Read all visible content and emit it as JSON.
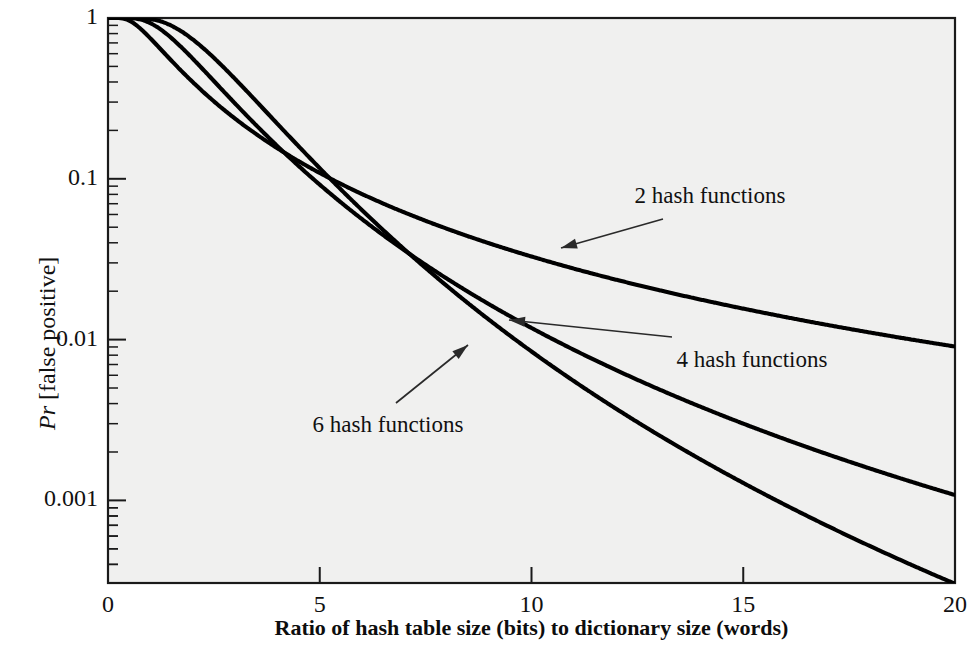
{
  "figure": {
    "background": "#ffffff",
    "plot_background": "#f0f0ef",
    "line_color": "#000000",
    "axis_color": "#1a1a1a"
  },
  "axis_titles": {
    "x": "Ratio of hash table size (bits) to dictionary size (words)",
    "y_prefix": "Pr",
    "y_suffix": " [false positive]"
  },
  "x_ticks": [
    "0",
    "5",
    "10",
    "15",
    "20"
  ],
  "y_ticks": [
    "1",
    "0.1",
    "0.01",
    "0.001"
  ],
  "annotations": {
    "k2": "2 hash functions",
    "k4": "4 hash functions",
    "k6": "6 hash functions"
  },
  "bleed_text": [
    "to the hash table, we set to 1. Check for a 1 in",
    "each seventh bit of the hash table; if it is 1, then the",
    "is false.",
    "When a new password is presented to the system,",
    "calculated and the corresponding bits of the hash table are",
    "password is easy. All passwords in the dictionary will be",
    "also be some  false positives  if a password is rejected, it",
    "but produce a match in the hash table. Set the number of",
    "hash functions. Suppose that the password is the same and",
    "dictionary is the same. To further suppose that",
    "Pr(no match) = (1 - 1/N)^(kn)   Pr(match|not in) < (1 -  ... )^k   (A)(1-",
    "and 2k(1/N)   ...   2ks   ...   (1-1/N)^(kn) ... 6.5s   1s.2k  9.5s",
    "In the password/MC step it is presented to the system, it is",
    "enough function to the dictionary; if there are too many such filter",
    "different to lead to each password; if they would, we would need"
  ],
  "chart_data": {
    "type": "line",
    "title": "",
    "xlabel": "Ratio of hash table size (bits) to dictionary size (words)",
    "ylabel": "Pr [false positive]",
    "xlim": [
      0,
      20
    ],
    "ylim": [
      0.00035,
      1
    ],
    "yscale": "log",
    "grid": false,
    "legend": "inline-annotations",
    "x": [
      0,
      1,
      2,
      3,
      4,
      5,
      6,
      7,
      8,
      9,
      10,
      11,
      12,
      13,
      14,
      15,
      16,
      17,
      18,
      19,
      20
    ],
    "series": [
      {
        "name": "2 hash functions",
        "k": 2,
        "values": [
          1.0,
          0.6322,
          0.3996,
          0.2653,
          0.1847,
          0.134,
          0.1005,
          0.0775,
          0.0611,
          0.0492,
          0.0402,
          0.0334,
          0.0281,
          0.0239,
          0.0205,
          0.0178,
          0.0155,
          0.0136,
          0.012,
          0.0107,
          0.0095
        ]
      },
      {
        "name": "4 hash functions",
        "k": 4,
        "values": [
          1.0,
          0.9204,
          0.6396,
          0.406,
          0.2496,
          0.1549,
          0.0982,
          0.0639,
          0.0426,
          0.0291,
          0.0203,
          0.0145,
          0.0105,
          0.0077,
          0.0058,
          0.0044,
          0.0034,
          0.0026,
          0.0021,
          0.0016,
          0.0013
        ]
      },
      {
        "name": "6 hash functions",
        "k": 6,
        "values": [
          1.0,
          0.9889,
          0.7792,
          0.4998,
          0.293,
          0.1636,
          0.0904,
          0.0501,
          0.0281,
          0.0161,
          0.0094,
          0.0056,
          0.0034,
          0.0021,
          0.0013,
          0.00086,
          0.00056,
          0.00037,
          0.00025,
          0.00017,
          0.00012
        ]
      }
    ]
  }
}
